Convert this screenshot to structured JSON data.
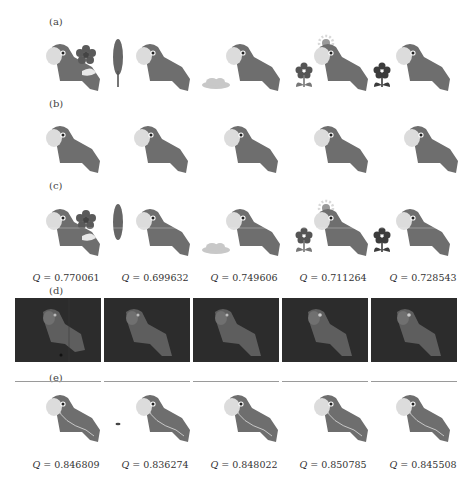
{
  "figure": {
    "panels": [
      {
        "id": "a",
        "label": "(a)",
        "description": "parrot with distractor objects",
        "objects": [
          "flower-red",
          "leaf",
          "cloud",
          "flower-sun",
          "flower-dark"
        ]
      },
      {
        "id": "b",
        "label": "(b)",
        "description": "parrot only (ground truth)",
        "objects": [
          "none",
          "none",
          "none",
          "none",
          "none"
        ]
      },
      {
        "id": "c",
        "label": "(c)",
        "description": "result with score",
        "objects": [
          "flower-red",
          "leaf",
          "cloud",
          "flower-sun",
          "flower-dark"
        ],
        "scores": [
          "0.770061",
          "0.699632",
          "0.749606",
          "0.711264",
          "0.728543"
        ]
      },
      {
        "id": "d",
        "label": "(d)",
        "description": "dark saliency map"
      },
      {
        "id": "e",
        "label": "(e)",
        "description": "segmented parrot with score",
        "scores": [
          "0.846809",
          "0.836274",
          "0.848022",
          "0.850785",
          "0.845508"
        ]
      }
    ],
    "q_symbol": "Q",
    "equals": " = ",
    "colors": {
      "parrot_body": "#6e6e6e",
      "parrot_face": "#dcdcdc",
      "dark_background": "#2c2c2c",
      "separator": "#9a9a9a"
    }
  }
}
